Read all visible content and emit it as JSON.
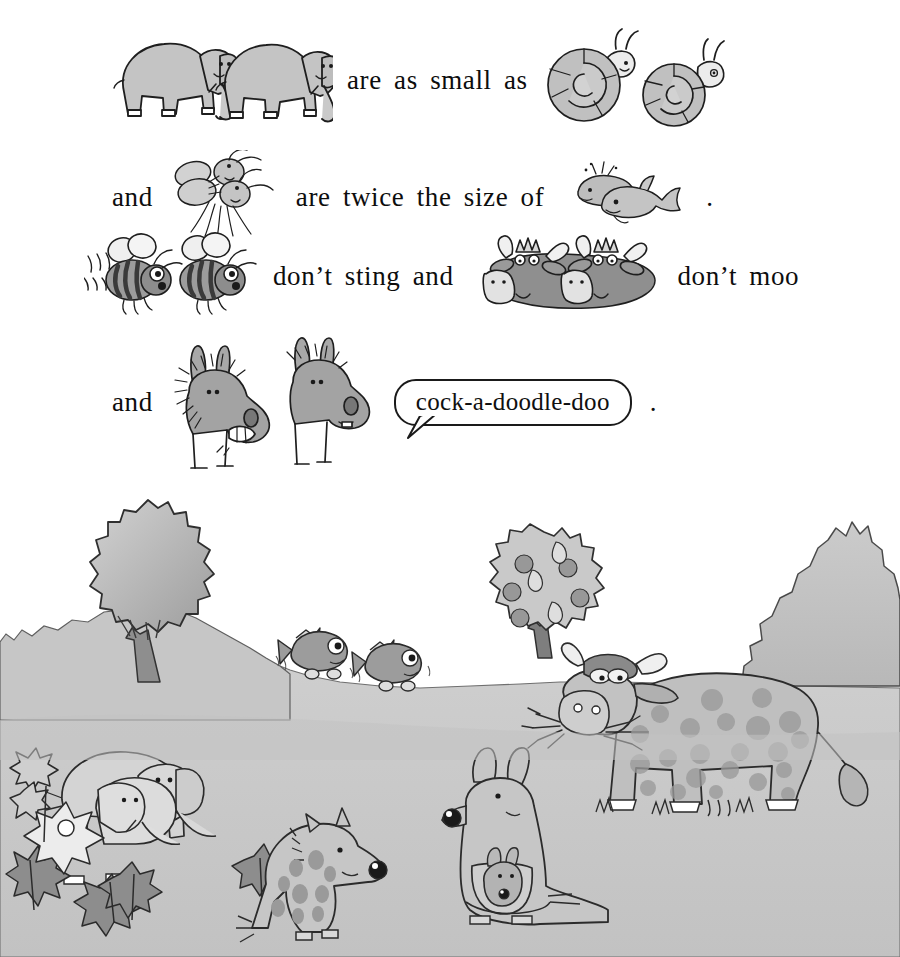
{
  "page": {
    "title": "Mixed-Up Animals",
    "background_color": "#ffffff",
    "ink_color": "#1a1a1a",
    "fill_light": "#c9c9c9",
    "fill_mid": "#a8a8a8",
    "fill_dark": "#8a8a8a",
    "ground_color": "#c7c7c7",
    "hill_color": "#c0c0c0"
  },
  "story": {
    "lines": [
      {
        "id": "line-1",
        "segments": [
          {
            "kind": "illustration",
            "name": "elephants-pair",
            "label": "two elephants",
            "count": 2
          },
          {
            "kind": "text",
            "value": "are as small as"
          },
          {
            "kind": "illustration",
            "name": "snails-pair",
            "label": "two snails",
            "count": 2
          }
        ]
      },
      {
        "id": "line-2",
        "segments": [
          {
            "kind": "text",
            "value": "and"
          },
          {
            "kind": "illustration",
            "name": "mosquitoes-pair",
            "label": "two mosquitoes",
            "count": 2
          },
          {
            "kind": "text",
            "value": "are twice the size of"
          },
          {
            "kind": "illustration",
            "name": "whales-pair",
            "label": "two whales",
            "count": 2
          },
          {
            "kind": "text",
            "value": "."
          }
        ]
      },
      {
        "id": "line-3",
        "segments": [
          {
            "kind": "illustration",
            "name": "bees-pair",
            "label": "two bees",
            "count": 2
          },
          {
            "kind": "text",
            "value": "don’t sting and"
          },
          {
            "kind": "illustration",
            "name": "cows-pair",
            "label": "two cow heads",
            "count": 2
          },
          {
            "kind": "text",
            "value": "don’t moo"
          }
        ]
      },
      {
        "id": "line-4",
        "segments": [
          {
            "kind": "text",
            "value": "and"
          },
          {
            "kind": "illustration",
            "name": "donkeys-pair",
            "label": "two donkeys",
            "count": 2
          },
          {
            "kind": "speech",
            "name": "speech-bubble",
            "value": "cock-a-doodle-doo"
          },
          {
            "kind": "text",
            "value": "."
          }
        ]
      }
    ],
    "text": {
      "are_as_small_as": "are as small as",
      "and_1": "and",
      "are_twice_the_size_of": "are twice the size of",
      "period_1": ".",
      "dont_sting_and": "don’t sting and",
      "dont_moo": "don’t moo",
      "and_2": "and",
      "speech_bubble": "cock-a-doodle-doo",
      "period_2": "."
    }
  },
  "scene": {
    "name": "countryside-landscape",
    "description": "A hilly countryside with trees, a bush, and mixed-up animals",
    "elements": [
      {
        "name": "round-tree",
        "label": "round leafy tree on left hill"
      },
      {
        "name": "fruit-tree",
        "label": "fruit tree with apples and pears"
      },
      {
        "name": "bush",
        "label": "large spiky bush on the right"
      },
      {
        "name": "flying-fish",
        "label": "two flying fish with feet",
        "count": 2
      },
      {
        "name": "elephants-small",
        "label": "two small elephants in the flowers",
        "count": 2
      },
      {
        "name": "flowers",
        "label": "flowers and leaves at bottom left"
      },
      {
        "name": "spotted-hyena",
        "label": "sitting spotted hyena"
      },
      {
        "name": "kangaroo",
        "label": "kangaroo with joey in pouch"
      },
      {
        "name": "joey",
        "label": "baby kangaroo in pouch"
      },
      {
        "name": "spotted-cow",
        "label": "large spotted cow eating grass"
      }
    ],
    "fruit": {
      "apples": 5,
      "pears": 3
    },
    "cow": {
      "spots": 22,
      "has_horns": true,
      "has_udder": true,
      "eating": "grass"
    }
  }
}
